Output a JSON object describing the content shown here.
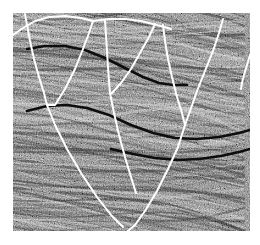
{
  "figure": {
    "kind": "seismic-reflection-profile",
    "caption": "",
    "background_color": "#ffffff",
    "panel": {
      "x": 13,
      "y": 13,
      "width": 237,
      "height": 218,
      "base_gray": "#8a8a8a",
      "description": "Grayscale seismic reflection section with folded and faulted strata"
    }
  },
  "style": {
    "fault_color": "#ffffff",
    "fault_width": 2.0,
    "horizon_color": "#0d0d0d",
    "horizon_width": 2.6,
    "noise_dark": "#1c1c1c",
    "noise_light": "#e8e8e8",
    "reflector_dark": "#2a2a2a",
    "reflector_light": "#d8d8d8"
  },
  "chart_data": {
    "type": "line",
    "title": "",
    "xlabel": "",
    "ylabel": "",
    "xlim": [
      0,
      237
    ],
    "ylim": [
      0,
      218
    ],
    "grid": false,
    "legend": null,
    "series": [
      {
        "name": "fault-f1-left-branch",
        "role": "fault",
        "color": "#ffffff",
        "points": [
          [
            12,
            1
          ],
          [
            14,
            12
          ],
          [
            17,
            28
          ],
          [
            21,
            46
          ],
          [
            26,
            64
          ],
          [
            31,
            80
          ],
          [
            34,
            92
          ]
        ]
      },
      {
        "name": "horizon-h0-top-left-arc",
        "role": "horizon-pick",
        "color": "#ffffff",
        "points": [
          [
            0,
            22
          ],
          [
            10,
            15
          ],
          [
            22,
            8
          ],
          [
            36,
            4
          ],
          [
            52,
            3
          ],
          [
            68,
            5
          ],
          [
            80,
            8
          ]
        ]
      },
      {
        "name": "fault-f2-right-branch",
        "role": "fault",
        "color": "#ffffff",
        "points": [
          [
            80,
            8
          ],
          [
            76,
            20
          ],
          [
            70,
            36
          ],
          [
            62,
            56
          ],
          [
            52,
            76
          ],
          [
            42,
            92
          ],
          [
            34,
            92
          ]
        ]
      },
      {
        "name": "fault-f1-long-limb",
        "role": "fault",
        "color": "#ffffff",
        "points": [
          [
            34,
            92
          ],
          [
            42,
            112
          ],
          [
            54,
            136
          ],
          [
            68,
            160
          ],
          [
            84,
            184
          ],
          [
            98,
            202
          ],
          [
            110,
            214
          ]
        ]
      },
      {
        "name": "horizon-h0b-top-mid",
        "role": "horizon-pick",
        "color": "#ffffff",
        "points": [
          [
            80,
            8
          ],
          [
            96,
            6
          ],
          [
            112,
            6
          ],
          [
            128,
            8
          ],
          [
            144,
            12
          ],
          [
            158,
            16
          ]
        ]
      },
      {
        "name": "fault-f3-left-branch",
        "role": "fault",
        "color": "#ffffff",
        "points": [
          [
            92,
            8
          ],
          [
            93,
            22
          ],
          [
            94,
            38
          ],
          [
            95,
            54
          ],
          [
            96,
            68
          ],
          [
            97,
            80
          ]
        ]
      },
      {
        "name": "fault-f3-right-branch",
        "role": "fault",
        "color": "#ffffff",
        "points": [
          [
            142,
            11
          ],
          [
            136,
            24
          ],
          [
            127,
            40
          ],
          [
            118,
            56
          ],
          [
            108,
            70
          ],
          [
            99,
            80
          ],
          [
            97,
            80
          ]
        ]
      },
      {
        "name": "fault-f3-long-limb",
        "role": "fault",
        "color": "#ffffff",
        "points": [
          [
            97,
            80
          ],
          [
            101,
            100
          ],
          [
            106,
            122
          ],
          [
            112,
            144
          ],
          [
            118,
            164
          ],
          [
            123,
            180
          ]
        ]
      },
      {
        "name": "fault-f4-left-branch",
        "role": "fault",
        "color": "#ffffff",
        "points": [
          [
            150,
            12
          ],
          [
            152,
            28
          ],
          [
            155,
            46
          ],
          [
            159,
            64
          ],
          [
            164,
            84
          ],
          [
            169,
            100
          ],
          [
            172,
            112
          ]
        ]
      },
      {
        "name": "fault-f4-right-branch",
        "role": "fault",
        "color": "#ffffff",
        "points": [
          [
            210,
            6
          ],
          [
            206,
            20
          ],
          [
            200,
            38
          ],
          [
            192,
            58
          ],
          [
            184,
            78
          ],
          [
            177,
            98
          ],
          [
            172,
            112
          ]
        ]
      },
      {
        "name": "fault-f4-long-limb",
        "role": "fault",
        "color": "#ffffff",
        "points": [
          [
            172,
            112
          ],
          [
            165,
            134
          ],
          [
            155,
            156
          ],
          [
            144,
            178
          ],
          [
            132,
            198
          ],
          [
            122,
            212
          ],
          [
            115,
            218
          ]
        ]
      },
      {
        "name": "fault-f5-right-edge",
        "role": "fault",
        "color": "#ffffff",
        "points": [
          [
            237,
            42
          ],
          [
            234,
            52
          ],
          [
            231,
            62
          ],
          [
            229,
            70
          ],
          [
            228,
            76
          ]
        ]
      },
      {
        "name": "reflector-r1-upper-dark",
        "role": "horizon",
        "color": "#0d0d0d",
        "points": [
          [
            14,
            36
          ],
          [
            32,
            33
          ],
          [
            52,
            33
          ],
          [
            72,
            37
          ],
          [
            92,
            45
          ],
          [
            112,
            55
          ],
          [
            130,
            64
          ],
          [
            146,
            70
          ],
          [
            160,
            72
          ],
          [
            174,
            72
          ]
        ]
      },
      {
        "name": "reflector-r2-mid-dark",
        "role": "horizon",
        "color": "#0d0d0d",
        "points": [
          [
            14,
            98
          ],
          [
            34,
            93
          ],
          [
            54,
            92
          ],
          [
            74,
            95
          ],
          [
            96,
            102
          ],
          [
            118,
            112
          ],
          [
            140,
            120
          ],
          [
            162,
            125
          ],
          [
            184,
            126
          ],
          [
            206,
            124
          ],
          [
            226,
            120
          ],
          [
            237,
            117
          ]
        ]
      },
      {
        "name": "reflector-r3-lower-dark",
        "role": "horizon",
        "color": "#0d0d0d",
        "points": [
          [
            98,
            136
          ],
          [
            120,
            141
          ],
          [
            142,
            145
          ],
          [
            164,
            147
          ],
          [
            186,
            146
          ],
          [
            208,
            143
          ],
          [
            226,
            139
          ],
          [
            237,
            136
          ]
        ]
      }
    ]
  }
}
